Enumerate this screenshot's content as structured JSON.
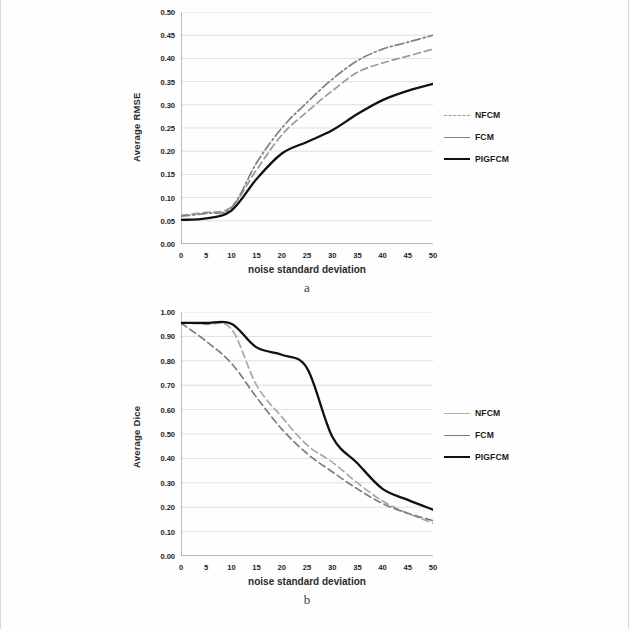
{
  "figure": {
    "panel_a_letter": "a",
    "panel_b_letter": "b"
  },
  "chart_data": [
    {
      "id": "a",
      "type": "line",
      "title": "",
      "xlabel": "noise standard deviation",
      "ylabel": "Average RMSE",
      "xlim": [
        0,
        50
      ],
      "ylim": [
        0.0,
        0.5
      ],
      "xticks": [
        "0",
        "5",
        "10",
        "15",
        "20",
        "25",
        "30",
        "35",
        "40",
        "45",
        "50"
      ],
      "yticks": [
        "0.00",
        "0.05",
        "0.10",
        "0.15",
        "0.20",
        "0.25",
        "0.30",
        "0.35",
        "0.40",
        "0.45",
        "0.50"
      ],
      "grid": true,
      "legend_position": "right",
      "x": [
        0,
        5,
        10,
        15,
        20,
        25,
        30,
        35,
        40,
        45,
        50
      ],
      "series": [
        {
          "name": "NFCM",
          "style": "dashed",
          "color": "#9a9a9a",
          "values": [
            0.062,
            0.068,
            0.08,
            0.16,
            0.235,
            0.285,
            0.33,
            0.37,
            0.39,
            0.405,
            0.42
          ]
        },
        {
          "name": "FCM",
          "style": "dash-dot",
          "color": "#808080",
          "values": [
            0.06,
            0.066,
            0.078,
            0.175,
            0.25,
            0.305,
            0.355,
            0.395,
            0.42,
            0.435,
            0.45
          ]
        },
        {
          "name": "PIGFCM",
          "style": "solid",
          "color": "#111111",
          "values": [
            0.052,
            0.055,
            0.072,
            0.14,
            0.195,
            0.22,
            0.245,
            0.28,
            0.31,
            0.33,
            0.345
          ]
        }
      ]
    },
    {
      "id": "b",
      "type": "line",
      "title": "",
      "xlabel": "noise standard deviation",
      "ylabel": "Average Dice",
      "xlim": [
        0,
        50
      ],
      "ylim": [
        0.0,
        1.0
      ],
      "xticks": [
        "0",
        "5",
        "10",
        "15",
        "20",
        "25",
        "30",
        "35",
        "40",
        "45",
        "50"
      ],
      "yticks": [
        "0.00",
        "0.10",
        "0.20",
        "0.30",
        "0.40",
        "0.50",
        "0.60",
        "0.70",
        "0.80",
        "0.90",
        "1.00"
      ],
      "grid": true,
      "legend_position": "right",
      "x": [
        0,
        5,
        10,
        15,
        20,
        25,
        30,
        35,
        40,
        45,
        50
      ],
      "series": [
        {
          "name": "NFCM",
          "style": "dashed",
          "color": "#a8a8a8",
          "values": [
            0.955,
            0.95,
            0.93,
            0.7,
            0.57,
            0.455,
            0.385,
            0.3,
            0.225,
            0.175,
            0.135
          ]
        },
        {
          "name": "FCM",
          "style": "dashed",
          "color": "#7d7d7d",
          "values": [
            0.955,
            0.88,
            0.79,
            0.65,
            0.52,
            0.42,
            0.345,
            0.275,
            0.215,
            0.175,
            0.145
          ]
        },
        {
          "name": "PIGFCM",
          "style": "solid",
          "color": "#111111",
          "values": [
            0.955,
            0.955,
            0.952,
            0.855,
            0.825,
            0.77,
            0.49,
            0.38,
            0.275,
            0.23,
            0.19
          ]
        }
      ]
    }
  ],
  "legend_a": {
    "items": [
      {
        "label": "NFCM",
        "color": "#9a9a9a",
        "style": "dashed"
      },
      {
        "label": "FCM",
        "color": "#808080",
        "style": "solid"
      },
      {
        "label": "PIGFCM",
        "color": "#111111",
        "style": "solid-bold"
      }
    ]
  },
  "legend_b": {
    "items": [
      {
        "label": "NFCM",
        "color": "#b0b0b0",
        "style": "solid"
      },
      {
        "label": "FCM",
        "color": "#7d7d7d",
        "style": "solid"
      },
      {
        "label": "PIGFCM",
        "color": "#111111",
        "style": "solid-bold"
      }
    ]
  }
}
